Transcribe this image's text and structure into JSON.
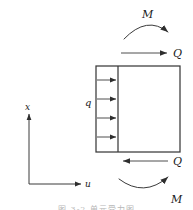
{
  "figure": {
    "type": "mechanics-free-body-diagram",
    "stroke_color": "#3a3a3a",
    "label_color": "#1a1a1a",
    "background": "#ffffff"
  },
  "labels": {
    "moment_top": "M",
    "moment_bottom": "M",
    "shear_top": "Q",
    "shear_bottom": "Q",
    "distributed_load": "q",
    "axis_vertical": "x",
    "axis_horizontal": "u"
  },
  "caption": {
    "text": "图 3-2    单元受力图"
  },
  "geometry": {
    "rect": {
      "x": 96,
      "y": 66,
      "width": 84,
      "height": 86
    },
    "divider_x": 118,
    "load_arrow_count": 4,
    "load_arrow_y": [
      80,
      98,
      118,
      138
    ],
    "load_arrow_x_start": 97,
    "load_arrow_x_end": 118,
    "shear_top_arrow": {
      "x1": 122,
      "y1": 53,
      "x2": 168,
      "y2": 53,
      "direction": "right"
    },
    "shear_bottom_arrow": {
      "x1": 168,
      "y1": 161,
      "x2": 122,
      "y2": 161,
      "direction": "left"
    },
    "moment_top_curve": {
      "from": [
        124,
        39
      ],
      "to": [
        169,
        33
      ],
      "bulge": "up"
    },
    "moment_bottom_curve": {
      "from": [
        120,
        180
      ],
      "to": [
        170,
        176
      ],
      "bulge": "down"
    },
    "axis_origin": [
      29,
      184
    ],
    "axis_vertical_top": [
      29,
      112
    ],
    "axis_horizontal_right": [
      83,
      184
    ]
  }
}
